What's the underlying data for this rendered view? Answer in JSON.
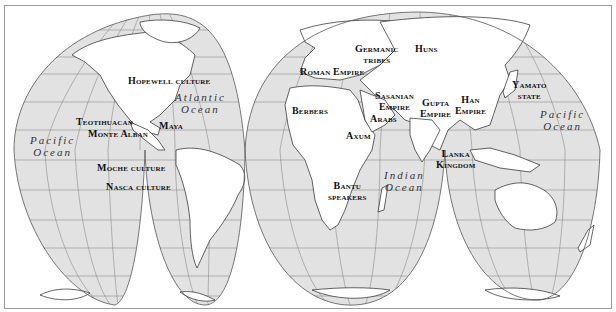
{
  "map": {
    "projection": "interrupted homolosine world map",
    "colors": {
      "ocean": "#e2e2e2",
      "land": "#ffffff",
      "graticule": "#7a7a7a",
      "coast": "#222222",
      "frame": "#9a9a9a"
    },
    "oceans": [
      {
        "id": "pacific-west",
        "line1": "Pacific",
        "line2": "Ocean"
      },
      {
        "id": "atlantic",
        "line1": "Atlantic",
        "line2": "Ocean"
      },
      {
        "id": "indian",
        "line1": "Indian",
        "line2": "Ocean"
      },
      {
        "id": "pacific-east",
        "line1": "Pacific",
        "line2": "Ocean"
      }
    ],
    "labels": [
      {
        "id": "hopewell",
        "text": "Hopewell culture"
      },
      {
        "id": "teotihuacan",
        "text": "Teotihuacan"
      },
      {
        "id": "monte-alban",
        "text": "Monte Alban"
      },
      {
        "id": "maya",
        "text": "Maya"
      },
      {
        "id": "moche",
        "text": "Moche culture"
      },
      {
        "id": "nasca",
        "text": "Nasca culture"
      },
      {
        "id": "roman",
        "text": "Roman Empire"
      },
      {
        "id": "germanic1",
        "text": "Germanic"
      },
      {
        "id": "germanic2",
        "text": "tribes"
      },
      {
        "id": "huns",
        "text": "Huns"
      },
      {
        "id": "berbers",
        "text": "Berbers"
      },
      {
        "id": "sasanian1",
        "text": "Sasanian"
      },
      {
        "id": "sasanian2",
        "text": "Empire"
      },
      {
        "id": "arabs",
        "text": "Arabs"
      },
      {
        "id": "axum",
        "text": "Axum"
      },
      {
        "id": "gupta1",
        "text": "Gupta"
      },
      {
        "id": "gupta2",
        "text": "Empire"
      },
      {
        "id": "han1",
        "text": "Han"
      },
      {
        "id": "han2",
        "text": "Empire"
      },
      {
        "id": "yamato1",
        "text": "Yamato"
      },
      {
        "id": "yamato2",
        "text": "state"
      },
      {
        "id": "lanka1",
        "text": "Lanka"
      },
      {
        "id": "lanka2",
        "text": "Kingdom"
      },
      {
        "id": "bantu1",
        "text": "Bantu"
      },
      {
        "id": "bantu2",
        "text": "speakers"
      }
    ]
  }
}
